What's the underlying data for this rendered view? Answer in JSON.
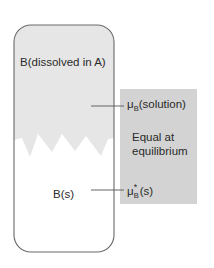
{
  "diagram": {
    "container": {
      "upper_phase_label": "B(dissolved in A)",
      "lower_phase_label": "B(s)"
    },
    "panel": {
      "mu_solution": {
        "symbol": "μ",
        "subscript": "B",
        "superscript": "",
        "suffix": "(solution)"
      },
      "mu_solid": {
        "symbol": "μ",
        "subscript": "B",
        "superscript": "*",
        "suffix": "(s)"
      },
      "equal_line1": "Equal at",
      "equal_line2": "equilibrium"
    },
    "colors": {
      "solution_fill": "#e6e6e6",
      "solid_fill": "#ffffff",
      "panel_fill": "#d3d3d3",
      "outline": "#6a6a6a",
      "leader_line": "#555555"
    }
  }
}
